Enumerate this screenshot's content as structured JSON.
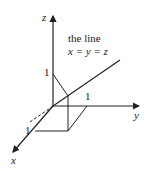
{
  "figure": {
    "title_line1": "the line",
    "title_line2": "x = y = z",
    "axes": {
      "x_label": "x",
      "y_label": "y",
      "z_label": "z"
    },
    "ticks": {
      "x_tick": "1",
      "y_tick": "1",
      "z_tick": "1"
    },
    "colors": {
      "ink": "#222222",
      "background": "#ffffff"
    }
  }
}
